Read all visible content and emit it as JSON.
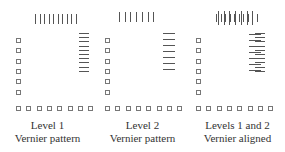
{
  "panels": [
    {
      "id": "level1",
      "caption_line1": "Level 1",
      "caption_line2": "Vernier pattern",
      "vertical_ticks": 10,
      "horizontal_ticks": 10
    },
    {
      "id": "level2",
      "caption_line1": "Level 2",
      "caption_line2": "Vernier pattern",
      "vertical_ticks": 7,
      "horizontal_ticks": 7
    },
    {
      "id": "aligned",
      "caption_line1": "Levels 1 and 2",
      "caption_line2": "Vernier aligned",
      "vertical_ticks": 17,
      "horizontal_ticks": 17
    }
  ],
  "squares": {
    "left_column": 6,
    "bottom_row": 8
  }
}
